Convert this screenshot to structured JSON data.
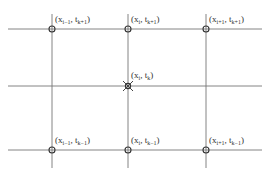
{
  "diagram": {
    "type": "finite-difference stencil grid",
    "colors": {
      "grid": "#777777",
      "point": "#333333",
      "label": "#333333"
    },
    "grid": {
      "vertical_lines_x": [
        52,
        128,
        206
      ],
      "horizontal_lines_y": [
        29,
        86,
        150
      ],
      "x_extent": [
        8,
        262
      ],
      "y_extent": [
        14,
        168
      ]
    },
    "nodes": [
      {
        "id": "n1",
        "x": 52,
        "y": 29,
        "marker": "circle",
        "label": {
          "pre": "(x",
          "xs": "i−1",
          "mid": ", t",
          "ts": "k+1",
          "post": ")"
        }
      },
      {
        "id": "n2",
        "x": 128,
        "y": 29,
        "marker": "circle",
        "label": {
          "pre": "(x",
          "xs": "i",
          "mid": ", t",
          "ts": "k+1",
          "post": ")"
        }
      },
      {
        "id": "n3",
        "x": 206,
        "y": 29,
        "marker": "circle",
        "label": {
          "pre": "(x",
          "xs": "i+1",
          "mid": ", t",
          "ts": "k+1",
          "post": ")"
        }
      },
      {
        "id": "n4",
        "x": 128,
        "y": 86,
        "marker": "cross",
        "label": {
          "pre": "(x",
          "xs": "i",
          "mid": ", t",
          "ts": "k",
          "post": ")"
        }
      },
      {
        "id": "n5",
        "x": 52,
        "y": 150,
        "marker": "circle",
        "label": {
          "pre": "(x",
          "xs": "i−1",
          "mid": ", t",
          "ts": "k−1",
          "post": ")"
        }
      },
      {
        "id": "n6",
        "x": 128,
        "y": 150,
        "marker": "circle",
        "label": {
          "pre": "(x",
          "xs": "i",
          "mid": ", t",
          "ts": "k−1",
          "post": ")"
        }
      },
      {
        "id": "n7",
        "x": 206,
        "y": 150,
        "marker": "circle",
        "label": {
          "pre": "(x",
          "xs": "i+1",
          "mid": ", t",
          "ts": "k−1",
          "post": ")"
        }
      }
    ]
  }
}
